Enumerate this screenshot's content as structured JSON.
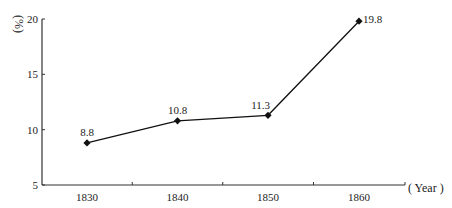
{
  "chart_data": {
    "type": "line",
    "title": "",
    "xlabel": "( Year )",
    "ylabel": "(%)",
    "categories": [
      "1830",
      "1840",
      "1850",
      "1860"
    ],
    "series": [
      {
        "name": "percentage",
        "values": [
          8.8,
          10.8,
          11.3,
          19.8
        ],
        "marker": "diamond",
        "color": "#111111"
      }
    ],
    "data_labels": [
      "8.8",
      "10.8",
      "11.3",
      "19.8"
    ],
    "ylim": [
      5,
      20
    ],
    "yticks": [
      5,
      10,
      15,
      20
    ],
    "ytick_labels": [
      "5",
      "10",
      "15",
      "20"
    ],
    "grid": false,
    "legend": "none"
  }
}
